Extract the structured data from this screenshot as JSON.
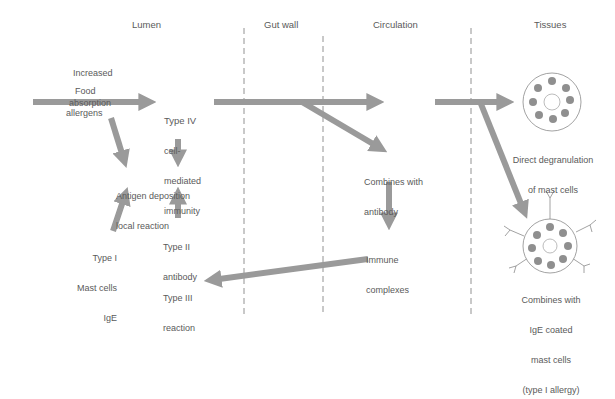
{
  "headers": {
    "lumen": "Lumen",
    "gut_wall": "Gut wall",
    "circulation": "Circulation",
    "tissues": "Tissues"
  },
  "labels": {
    "increased_absorption_1": "Increased",
    "increased_absorption_2": "absorption",
    "food": "Food",
    "allergens": "allergens",
    "type_iv_1": "Type IV",
    "type_iv_2": "cell-",
    "type_iv_3": "mediated",
    "type_iv_4": "immunity",
    "antigen_deposition_1": "Antigen deposition",
    "antigen_deposition_2": "local reaction",
    "type_i_1": "Type I",
    "type_i_2": "Mast cells",
    "type_i_3": "IgE",
    "type_ii_1": "Type II",
    "type_ii_2": "antibody",
    "type_iii_1": "Type III",
    "type_iii_2": "reaction",
    "combines_antibody_1": "Combines with",
    "combines_antibody_2": "antibody",
    "immune_complexes_1": "Immune",
    "immune_complexes_2": "complexes",
    "direct_degranulation_1": "Direct degranulation",
    "direct_degranulation_2": "of mast cells",
    "ige_coated_1": "Combines with",
    "ige_coated_2": "IgE coated",
    "ige_coated_3": "mast cells",
    "ige_coated_4": "(type I allergy)"
  },
  "colors": {
    "arrow": "#9a9a9a",
    "text": "#5a5a5a",
    "granule": "#8f8f8f",
    "divider": "#777777"
  }
}
